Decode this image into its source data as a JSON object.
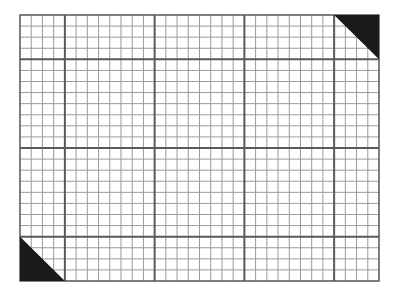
{
  "figure": {
    "columns": 32,
    "rows": 24,
    "major_every": 8,
    "major_offset": 4,
    "colors": {
      "background": "#ffffff",
      "minor_line": "#9a9a9a",
      "major_line": "#5a5a5a",
      "border": "#555555",
      "triangle_fill": "#1a1a1a"
    },
    "corner_markers": [
      {
        "corner": "top-right",
        "cells": 4
      },
      {
        "corner": "bottom-left",
        "cells": 4
      }
    ]
  }
}
